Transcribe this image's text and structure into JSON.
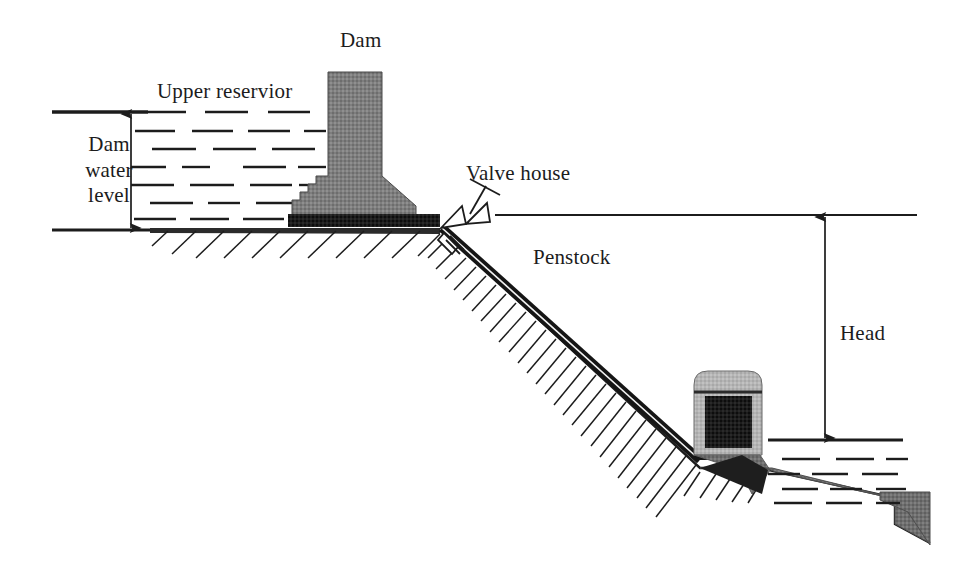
{
  "diagram": {
    "type": "technical-cross-section",
    "canvas": {
      "width": 956,
      "height": 579
    },
    "background_color": "#ffffff",
    "line_color": "#1c1c1c",
    "labels": {
      "dam": "Dam",
      "upper_reservoir": "Upper reservior",
      "dam_water_level": "Dam\nwater\nlevel",
      "valve_house": "Valve house",
      "penstock": "Penstock",
      "head": "Head"
    },
    "colors": {
      "dam_fill": "#7c7c7c",
      "dam_base_band": "#141414",
      "penstock_pipe": "#171717",
      "powerhouse_shell": "#b3b3b3",
      "powerhouse_core": "#1a1a1a",
      "terrain_fill": "#8a8a8a",
      "water_dash": "#1c1c1c",
      "outline": "#1c1c1c"
    },
    "elements": [
      {
        "name": "dam",
        "kind": "structure",
        "description": "Gravity dam with vertical crest column widening to a trapezoidal base and a dark foundation band"
      },
      {
        "name": "upper-reservoir",
        "kind": "water-body",
        "description": "Water impounded behind the dam, shown as staggered horizontal dashes"
      },
      {
        "name": "dam-water-level-dimension",
        "kind": "dimension",
        "description": "Double-headed vertical arrow from reservoir surface to reservoir bed"
      },
      {
        "name": "valve-house",
        "kind": "component",
        "description": "Butterfly valve symbol with stem and handwheel at the penstock intake"
      },
      {
        "name": "penstock",
        "kind": "conduit",
        "description": "Dark double-line pipe descending the hillside from the valve house to the powerhouse"
      },
      {
        "name": "hillside",
        "kind": "terrain",
        "description": "Hatched sloping ground surface"
      },
      {
        "name": "powerhouse",
        "kind": "structure",
        "description": "Light grey rounded-top housing containing a dark turbine/generator block"
      },
      {
        "name": "lower-reservoir",
        "kind": "water-body",
        "description": "Tailwater pool at the foot of the slope, staggered horizontal dashes"
      },
      {
        "name": "head-dimension",
        "kind": "dimension",
        "description": "Double-headed vertical arrow measuring gross head between the intake datum line and the tailwater surface"
      }
    ],
    "geometry": {
      "upper_water_surface_y": 112,
      "upper_reservoir_bed_y": 230,
      "dam_water_level_arrow_x": 131,
      "dam_crest_x_range": [
        328,
        382
      ],
      "intake_datum_line_y": 215,
      "intake_datum_line_x_range": [
        495,
        917
      ],
      "head_arrow_x": 825,
      "head_span_y": [
        215,
        440
      ],
      "tailwater_surface_y": 440,
      "tailwater_x_range": [
        768,
        903
      ],
      "powerhouse_x_range": [
        694,
        762
      ],
      "powerhouse_y_range": [
        371,
        455
      ]
    }
  }
}
